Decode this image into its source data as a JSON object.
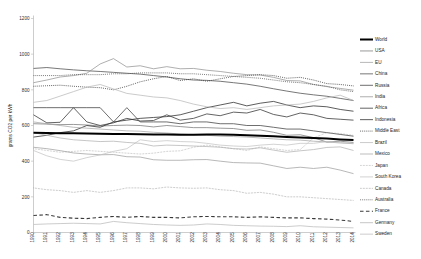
{
  "chart_data": {
    "type": "line",
    "title": "",
    "xlabel": "",
    "ylabel": "grams CO2 per kWh",
    "ylim": [
      0,
      1200
    ],
    "ytick_labels": [
      "0",
      "200",
      "400",
      "600",
      "800",
      "1000",
      "1200"
    ],
    "ytick_values": [
      0,
      200,
      400,
      600,
      800,
      1000,
      1200
    ],
    "grid": false,
    "legend_position": "right",
    "x": [
      1990,
      1991,
      1992,
      1993,
      1994,
      1995,
      1996,
      1997,
      1998,
      1999,
      2000,
      2001,
      2002,
      2003,
      2004,
      2005,
      2006,
      2007,
      2008,
      2009,
      2010,
      2011,
      2012,
      2013,
      2014
    ],
    "categories": [
      "1990",
      "1991",
      "1992",
      "1993",
      "1994",
      "1995",
      "1996",
      "1997",
      "1998",
      "1999",
      "2000",
      "2001",
      "2002",
      "2003",
      "2004",
      "2005",
      "2006",
      "2007",
      "2008",
      "2009",
      "2010",
      "2011",
      "2012",
      "2013",
      "2014"
    ],
    "series": [
      {
        "name": "World",
        "style": "solid",
        "width": 2.0,
        "color": "#000000",
        "values": [
          560,
          558,
          557,
          556,
          555,
          554,
          553,
          552,
          551,
          550,
          549,
          548,
          548,
          549,
          549,
          548,
          546,
          543,
          540,
          536,
          533,
          530,
          527,
          522,
          518
        ]
      },
      {
        "name": "USA",
        "style": "solid",
        "width": 0.7,
        "color": "#6e6e6e",
        "values": [
          610,
          608,
          605,
          606,
          603,
          597,
          600,
          602,
          600,
          592,
          600,
          594,
          588,
          588,
          585,
          583,
          573,
          575,
          562,
          545,
          548,
          532,
          507,
          512,
          505
        ]
      },
      {
        "name": "EU",
        "style": "solid",
        "width": 0.7,
        "color": "#9a9a9a",
        "values": [
          478,
          470,
          459,
          446,
          440,
          436,
          437,
          425,
          423,
          408,
          405,
          405,
          408,
          409,
          400,
          392,
          390,
          389,
          374,
          359,
          366,
          359,
          366,
          350,
          330
        ]
      },
      {
        "name": "China",
        "style": "solid",
        "width": 0.8,
        "color": "#565656",
        "values": [
          920,
          925,
          918,
          912,
          907,
          903,
          898,
          893,
          888,
          880,
          872,
          862,
          855,
          853,
          848,
          840,
          832,
          820,
          806,
          793,
          781,
          772,
          764,
          752,
          740
        ]
      },
      {
        "name": "Russia",
        "style": "solid",
        "width": 0.8,
        "color": "#4a4a4a",
        "values": [
          700,
          700,
          700,
          700,
          700,
          700,
          620,
          700,
          620,
          620,
          620,
          610,
          620,
          620,
          610,
          610,
          600,
          600,
          590,
          580,
          580,
          570,
          560,
          550,
          540
        ]
      },
      {
        "name": "India",
        "style": "solid",
        "width": 0.7,
        "color": "#8c8c8c",
        "values": [
          840,
          855,
          872,
          880,
          893,
          945,
          975,
          928,
          935,
          918,
          930,
          918,
          920,
          910,
          903,
          893,
          885,
          883,
          870,
          852,
          850,
          830,
          818,
          808,
          798
        ]
      },
      {
        "name": "Africa",
        "style": "solid",
        "width": 0.8,
        "color": "#3c3c3c",
        "values": [
          660,
          615,
          618,
          700,
          620,
          600,
          615,
          640,
          625,
          628,
          660,
          630,
          640,
          665,
          655,
          675,
          670,
          690,
          662,
          648,
          670,
          660,
          640,
          635,
          630
        ]
      },
      {
        "name": "Indonesia",
        "style": "solid",
        "width": 0.8,
        "color": "#333333",
        "values": [
          535,
          545,
          560,
          570,
          600,
          590,
          620,
          630,
          640,
          645,
          650,
          660,
          680,
          700,
          715,
          730,
          710,
          725,
          735,
          715,
          700,
          710,
          705,
          690,
          680
        ]
      },
      {
        "name": "Middle East",
        "style": "dotted",
        "width": 0.9,
        "color": "#3a3a3a",
        "values": [
          820,
          823,
          826,
          820,
          815,
          812,
          800,
          820,
          845,
          862,
          875,
          852,
          862,
          848,
          862,
          875,
          880,
          885,
          880,
          865,
          870,
          855,
          835,
          830,
          822
        ]
      },
      {
        "name": "Brazil",
        "style": "solid",
        "width": 0.7,
        "color": "#b5b5b5",
        "values": [
          730,
          740,
          765,
          790,
          815,
          830,
          805,
          780,
          770,
          760,
          755,
          740,
          720,
          705,
          695,
          700,
          690,
          700,
          710,
          715,
          720,
          735,
          755,
          770,
          740
        ]
      },
      {
        "name": "Mexico",
        "style": "solid",
        "width": 0.7,
        "color": "#a0a0a0",
        "values": [
          620,
          610,
          600,
          590,
          585,
          580,
          575,
          570,
          568,
          562,
          558,
          552,
          548,
          545,
          540,
          538,
          535,
          530,
          525,
          520,
          518,
          512,
          508,
          502,
          498
        ]
      },
      {
        "name": "Japan",
        "style": "dotted",
        "width": 0.7,
        "color": "#9c9c9c",
        "values": [
          470,
          460,
          450,
          455,
          460,
          455,
          450,
          445,
          440,
          445,
          455,
          458,
          478,
          490,
          480,
          470,
          460,
          480,
          470,
          460,
          465,
          530,
          560,
          555,
          545
        ]
      },
      {
        "name": "South Korea",
        "style": "solid",
        "width": 0.7,
        "color": "#c0c0c0",
        "values": [
          460,
          430,
          410,
          400,
          420,
          435,
          455,
          470,
          520,
          510,
          515,
          510,
          508,
          500,
          490,
          485,
          482,
          490,
          495,
          490,
          500,
          500,
          510,
          505,
          500
        ]
      },
      {
        "name": "Canada",
        "style": "dotted",
        "width": 0.7,
        "color": "#8a8a8a",
        "values": [
          250,
          240,
          235,
          225,
          235,
          225,
          235,
          250,
          250,
          245,
          255,
          250,
          248,
          250,
          240,
          235,
          220,
          225,
          215,
          200,
          200,
          195,
          190,
          185,
          180
        ]
      },
      {
        "name": "Australia",
        "style": "dotted",
        "width": 0.9,
        "color": "#555555",
        "values": [
          880,
          880,
          880,
          885,
          885,
          885,
          890,
          890,
          895,
          895,
          895,
          890,
          890,
          885,
          880,
          875,
          870,
          865,
          855,
          845,
          840,
          830,
          820,
          800,
          790
        ]
      },
      {
        "name": "France",
        "style": "dashed",
        "width": 1.1,
        "color": "#3a3a3a",
        "values": [
          95,
          100,
          85,
          80,
          78,
          85,
          90,
          85,
          90,
          85,
          85,
          82,
          88,
          90,
          88,
          88,
          85,
          88,
          85,
          82,
          82,
          78,
          75,
          70,
          62
        ]
      },
      {
        "name": "Germany",
        "style": "solid",
        "width": 0.7,
        "color": "#adadad",
        "values": [
          560,
          545,
          530,
          520,
          515,
          510,
          512,
          505,
          500,
          485,
          490,
          488,
          485,
          482,
          478,
          470,
          468,
          475,
          462,
          450,
          458,
          465,
          477,
          480,
          460
        ]
      },
      {
        "name": "Sweden",
        "style": "solid",
        "width": 0.8,
        "color": "#bfbfbf",
        "values": [
          45,
          48,
          50,
          52,
          50,
          48,
          62,
          55,
          50,
          45,
          42,
          40,
          42,
          48,
          45,
          40,
          38,
          36,
          35,
          33,
          38,
          32,
          30,
          28,
          26
        ]
      }
    ]
  },
  "legend": {
    "items": [
      {
        "label": "World"
      },
      {
        "label": "USA"
      },
      {
        "label": "EU"
      },
      {
        "label": "China"
      },
      {
        "label": "Russia"
      },
      {
        "label": "India"
      },
      {
        "label": "Africa"
      },
      {
        "label": "Indonesia"
      },
      {
        "label": "Middle East"
      },
      {
        "label": "Brazil"
      },
      {
        "label": "Mexico"
      },
      {
        "label": "Japan"
      },
      {
        "label": "South Korea"
      },
      {
        "label": "Canada"
      },
      {
        "label": "Australia"
      },
      {
        "label": "France"
      },
      {
        "label": "Germany"
      },
      {
        "label": "Sweden"
      }
    ]
  }
}
